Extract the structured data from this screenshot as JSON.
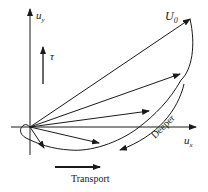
{
  "diagram": {
    "axes": {
      "y_label": "u",
      "y_sub": "y",
      "x_label": "u",
      "x_sub": "x"
    },
    "surface_velocity_label": "U",
    "surface_velocity_sub": "0",
    "stress_label": "τ",
    "depth_label": "Deeper",
    "transport_label": "Transport",
    "colors": {
      "ink": "#1a1a1a",
      "background": "#ffffff"
    },
    "origin": [
      30,
      127
    ],
    "velocity_vectors": [
      {
        "name": "surface",
        "tip": [
          190,
          19
        ]
      },
      {
        "name": "depth-1",
        "tip": [
          181,
          73
        ]
      },
      {
        "name": "depth-2",
        "tip": [
          150,
          111
        ]
      },
      {
        "name": "depth-3",
        "tip": [
          100,
          143
        ]
      },
      {
        "name": "depth-4",
        "tip": [
          44,
          148
        ]
      }
    ]
  }
}
